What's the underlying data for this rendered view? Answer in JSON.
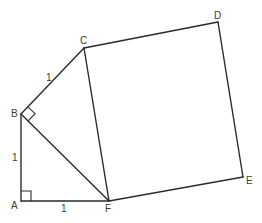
{
  "diagram": {
    "points": {
      "A": {
        "label": "A",
        "x": 21,
        "y": 201,
        "lx": 11,
        "ly": 209
      },
      "B": {
        "label": "B",
        "x": 21,
        "y": 114,
        "lx": 11,
        "ly": 117
      },
      "C": {
        "label": "C",
        "x": 84,
        "y": 48,
        "lx": 80,
        "ly": 44
      },
      "D": {
        "label": "D",
        "x": 218,
        "y": 22,
        "lx": 214,
        "ly": 19
      },
      "E": {
        "label": "E",
        "x": 243,
        "y": 177,
        "lx": 246,
        "ly": 184
      },
      "F": {
        "label": "F",
        "x": 109,
        "y": 201,
        "lx": 105,
        "ly": 212
      }
    },
    "lengths": {
      "BC": {
        "label": "1",
        "x": 46,
        "y": 81
      },
      "AB": {
        "label": "1",
        "x": 12,
        "y": 161
      },
      "AF": {
        "label": "1",
        "x": 61,
        "y": 212
      }
    },
    "right_angles": [
      "A",
      "B"
    ]
  }
}
